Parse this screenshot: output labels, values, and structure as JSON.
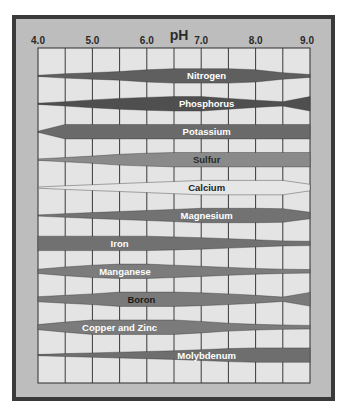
{
  "chart_data": {
    "type": "area",
    "title": "pH",
    "xlabel": "pH",
    "ylabel": "",
    "xlim": [
      4.0,
      9.0
    ],
    "x_ticks": [
      "4.0",
      "5.0",
      "6.0",
      "7.0",
      "8.0",
      "9.0"
    ],
    "grid": true,
    "legend": "none",
    "sample_ph": [
      4.0,
      4.5,
      5.0,
      5.5,
      6.0,
      6.5,
      7.0,
      7.5,
      8.0,
      8.5,
      9.0
    ],
    "series": [
      {
        "name": "Nitrogen",
        "label_color": "#ffffff",
        "fill": "#5f5f5f",
        "label_ph": 7.1,
        "values": [
          0.05,
          0.3,
          0.45,
          0.6,
          0.85,
          1.0,
          1.0,
          1.0,
          0.85,
          0.45,
          0.2
        ]
      },
      {
        "name": "Phosphorus",
        "label_color": "#ffffff",
        "fill": "#4f4f4f",
        "label_ph": 7.1,
        "values": [
          0.05,
          0.3,
          0.55,
          0.75,
          0.9,
          1.0,
          1.0,
          0.75,
          0.5,
          0.3,
          1.0
        ]
      },
      {
        "name": "Potassium",
        "label_color": "#ffffff",
        "fill": "#6a6a6a",
        "label_ph": 7.1,
        "values": [
          0.0,
          1.0,
          1.0,
          1.0,
          1.0,
          1.0,
          1.0,
          1.0,
          1.0,
          1.0,
          1.0
        ]
      },
      {
        "name": "Sulfur",
        "label_color": "#2a2a2a",
        "fill": "#8a8a8a",
        "label_ph": 7.1,
        "values": [
          0.1,
          0.3,
          0.5,
          0.75,
          0.9,
          1.0,
          1.0,
          1.0,
          1.0,
          1.0,
          1.0
        ]
      },
      {
        "name": "Calcium",
        "label_color": "#1e1e1e",
        "fill": "#e6e6e6",
        "label_ph": 7.1,
        "values": [
          0.05,
          0.25,
          0.4,
          0.55,
          0.7,
          0.85,
          1.0,
          1.0,
          1.0,
          1.0,
          0.45
        ]
      },
      {
        "name": "Magnesium",
        "label_color": "#ffffff",
        "fill": "#727272",
        "label_ph": 7.1,
        "values": [
          0.05,
          0.25,
          0.4,
          0.55,
          0.7,
          0.85,
          1.0,
          1.0,
          1.0,
          0.95,
          0.45
        ]
      },
      {
        "name": "Iron",
        "label_color": "#ffffff",
        "fill": "#717171",
        "label_ph": 5.5,
        "values": [
          1.0,
          1.0,
          1.0,
          1.0,
          1.0,
          0.9,
          0.8,
          0.65,
          0.5,
          0.35,
          0.3
        ]
      },
      {
        "name": "Manganese",
        "label_color": "#ffffff",
        "fill": "#7c7c7c",
        "label_ph": 5.6,
        "values": [
          0.3,
          0.6,
          0.85,
          1.0,
          1.0,
          0.85,
          0.7,
          0.55,
          0.4,
          0.3,
          0.25
        ]
      },
      {
        "name": "Boron",
        "label_color": "#1a1a1a",
        "fill": "#7a7a7a",
        "label_ph": 5.9,
        "values": [
          0.35,
          0.55,
          0.75,
          1.0,
          1.0,
          1.0,
          0.9,
          0.75,
          0.55,
          0.3,
          0.95
        ]
      },
      {
        "name": "Copper and Zinc",
        "label_color": "#ffffff",
        "fill": "#7b7b7b",
        "label_ph": 5.5,
        "values": [
          0.35,
          0.7,
          1.0,
          1.0,
          1.0,
          1.0,
          0.8,
          0.55,
          0.4,
          0.3,
          0.25
        ]
      },
      {
        "name": "Molybdenum",
        "label_color": "#ffffff",
        "fill": "#6e6e6e",
        "label_ph": 7.1,
        "values": [
          0.05,
          0.2,
          0.3,
          0.4,
          0.5,
          0.6,
          0.75,
          0.9,
          1.0,
          1.0,
          1.0
        ]
      }
    ]
  }
}
